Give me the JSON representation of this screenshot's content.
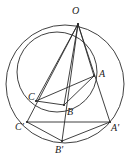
{
  "figure": {
    "background_color": "#ffffff",
    "stroke_color": "#2b2b2b",
    "label_color": "#1a1a1a",
    "width": 130,
    "height": 165
  },
  "points": {
    "O": {
      "label": "O",
      "x": 78,
      "y": 24,
      "label_x": 72,
      "label_y": 6
    },
    "A": {
      "label": "A",
      "x": 94,
      "y": 76,
      "label_x": 99,
      "label_y": 69
    },
    "B": {
      "label": "B",
      "x": 64,
      "y": 105,
      "label_x": 67,
      "label_y": 107
    },
    "C": {
      "label": "C",
      "x": 36,
      "y": 101,
      "label_x": 28,
      "label_y": 92
    },
    "Ap": {
      "label": "A'",
      "x": 110,
      "y": 122,
      "label_x": 111,
      "label_y": 123
    },
    "Bp": {
      "label": "B'",
      "x": 62,
      "y": 141,
      "label_x": 55,
      "label_y": 145
    },
    "Cp": {
      "label": "C'",
      "x": 27,
      "y": 122,
      "label_x": 15,
      "label_y": 122
    }
  },
  "circles": [
    {
      "name": "outer-circumscribed-circle",
      "cx": 65,
      "cy": 84,
      "r": 59
    },
    {
      "name": "inner-circumscribed-circle",
      "cx": 57,
      "cy": 72,
      "r": 40
    }
  ],
  "segments": [
    {
      "name": "segment-O-A",
      "from": "O",
      "to": "A"
    },
    {
      "name": "segment-O-B",
      "from": "O",
      "to": "B"
    },
    {
      "name": "segment-O-C",
      "from": "O",
      "to": "C"
    },
    {
      "name": "segment-O-Ap",
      "from": "O",
      "to": "Ap"
    },
    {
      "name": "segment-O-Bp",
      "from": "O",
      "to": "Bp"
    },
    {
      "name": "segment-O-Cp",
      "from": "O",
      "to": "Cp"
    },
    {
      "name": "segment-A-B",
      "from": "A",
      "to": "B"
    },
    {
      "name": "segment-B-C",
      "from": "B",
      "to": "C"
    },
    {
      "name": "segment-C-A",
      "from": "C",
      "to": "A"
    },
    {
      "name": "segment-Ap-Bp",
      "from": "Ap",
      "to": "Bp"
    },
    {
      "name": "segment-Bp-Cp",
      "from": "Bp",
      "to": "Cp"
    },
    {
      "name": "segment-Cp-Ap",
      "from": "Cp",
      "to": "Ap"
    }
  ]
}
